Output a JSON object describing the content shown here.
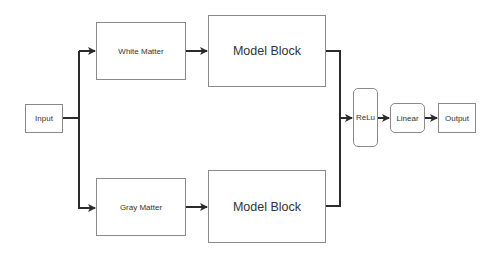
{
  "diagram": {
    "nodes": {
      "input": {
        "label": "Input"
      },
      "white_matter": {
        "label": "White Matter"
      },
      "gray_matter": {
        "label": "Gray Matter"
      },
      "model_block_top": {
        "label": "Model Block"
      },
      "model_block_bottom": {
        "label": "Model Block"
      },
      "relu": {
        "label": "ReLu"
      },
      "linear": {
        "label": "Linear"
      },
      "output": {
        "label": "Output"
      }
    },
    "edges": [
      {
        "from": "Input",
        "to": "White Matter"
      },
      {
        "from": "Input",
        "to": "Gray Matter"
      },
      {
        "from": "White Matter",
        "to": "Model Block"
      },
      {
        "from": "Gray Matter",
        "to": "Model Block"
      },
      {
        "from": "Model Block (top)",
        "to": "ReLu"
      },
      {
        "from": "Model Block (bottom)",
        "to": "ReLu"
      },
      {
        "from": "ReLu",
        "to": "Linear"
      },
      {
        "from": "Linear",
        "to": "Output"
      }
    ],
    "colors": {
      "line": "#2b2b2b",
      "border": "#8a8a8a",
      "background": "#ffffff"
    }
  }
}
